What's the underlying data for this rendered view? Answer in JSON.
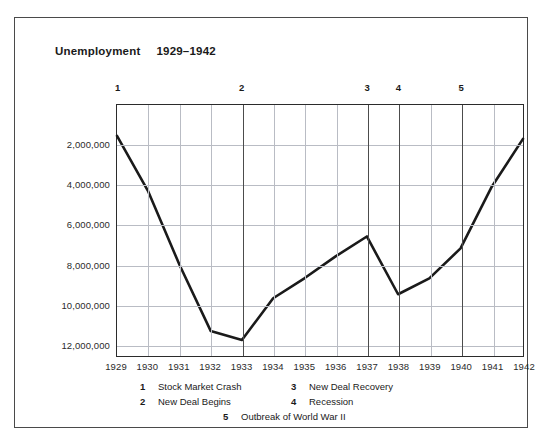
{
  "chart_data": {
    "type": "line",
    "title": "Unemployment",
    "title_range": "1929–1942",
    "xlabel": "",
    "ylabel": "",
    "grid": true,
    "legend_position": "below",
    "y_inverted": true,
    "ylim": [
      0,
      12600000
    ],
    "yticks": [
      2000000,
      4000000,
      6000000,
      8000000,
      10000000,
      12000000
    ],
    "ytick_labels": [
      "2,000,000",
      "4,000,000",
      "6,000,000",
      "8,000,000",
      "10,000,000",
      "12,000,000"
    ],
    "categories": [
      1929,
      1930,
      1931,
      1932,
      1933,
      1934,
      1935,
      1936,
      1937,
      1938,
      1939,
      1940,
      1941,
      1942
    ],
    "xtick_labels": [
      "1929",
      "1930",
      "1931",
      "1932",
      "1933",
      "1934",
      "1935",
      "1936",
      "1937",
      "1938",
      "1939",
      "1940",
      "1941",
      "1942"
    ],
    "values": [
      1550000,
      4340000,
      8020000,
      11340000,
      11800000,
      9700000,
      8700000,
      7600000,
      6600000,
      9500000,
      8700000,
      7200000,
      4100000,
      1700000
    ],
    "series": [
      {
        "name": "Unemployment",
        "color": "#1a1a1a",
        "values": [
          1550000,
          4340000,
          8020000,
          11340000,
          11800000,
          9700000,
          8700000,
          7600000,
          6600000,
          9500000,
          8700000,
          7200000,
          4100000,
          1700000
        ]
      }
    ],
    "annotations": [
      {
        "number": "1",
        "year": 1929,
        "label": "Stock Market Crash"
      },
      {
        "number": "2",
        "year": 1933,
        "label": "New Deal Begins"
      },
      {
        "number": "3",
        "year": 1937,
        "label": "New Deal Recovery"
      },
      {
        "number": "4",
        "year": 1938,
        "label": "Recession"
      },
      {
        "number": "5",
        "year": 1940,
        "label": "Outbreak of World War II"
      }
    ]
  },
  "legend": {
    "row1": {
      "n1": "1",
      "t1": "Stock Market Crash",
      "n2": "3",
      "t2": "New Deal Recovery"
    },
    "row2": {
      "n1": "2",
      "t1": "New Deal Begins",
      "n2": "4",
      "t2": "Recession"
    },
    "row3": {
      "n1": "5",
      "t1": "Outbreak of World War II"
    }
  },
  "colors": {
    "line": "#1a1a1a",
    "grid": "#b9bcc4",
    "axis": "#2b2b2b",
    "frame": "#4a4a4a"
  }
}
